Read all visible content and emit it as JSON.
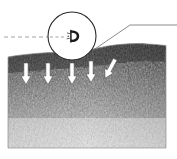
{
  "figure": {
    "background_color": "#ffffff",
    "width": 177,
    "height": 159
  },
  "specimen_panel": {
    "name": "fibrous-fracture-surface",
    "description": "Grainy fibrous cross-section texture, dark at the upper fracture zone fading lighter toward the bottom",
    "bounds": {
      "x": 8,
      "y": 47,
      "width": 158,
      "height": 101
    },
    "top_surface_profile": "irregular ridge rising from left to right",
    "colors": {
      "dark_zone": "#4a4a4a",
      "mid_zone": "#8c8c8c",
      "light_zone": "#d8d8d8",
      "border": "#9a9a9a"
    }
  },
  "load_arrows": {
    "name": "applied-load-arrows",
    "count": 5,
    "color": "#ffffff",
    "outline_color": "#555555",
    "direction": "downward",
    "items": [
      {
        "label": "arrow-1",
        "x": 26,
        "y": 63,
        "length": 22,
        "rotation": 0
      },
      {
        "label": "arrow-2",
        "x": 48,
        "y": 63,
        "length": 22,
        "rotation": 0
      },
      {
        "label": "arrow-3",
        "x": 72,
        "y": 63,
        "length": 22,
        "rotation": 0
      },
      {
        "label": "arrow-4",
        "x": 91,
        "y": 61,
        "length": 22,
        "rotation": 0
      },
      {
        "label": "arrow-5",
        "x": 110,
        "y": 58,
        "length": 22,
        "rotation": 28
      }
    ]
  },
  "callout_circle": {
    "name": "magnification-circle",
    "center_x": 72,
    "center_y": 36,
    "radius": 24,
    "stroke_color": "#2b2b2b",
    "fill_color": "#ffffff",
    "detail_name": "crack-tip-detail",
    "detail_description": "small dark hooked crack-tip mark at circle centre"
  },
  "dash_line": {
    "name": "axis-dashed-line",
    "from_x": 4,
    "to_x": 72,
    "y": 37,
    "color": "#8a8a8a",
    "dash_pattern": "4 3"
  },
  "leader_line": {
    "name": "callout-leader-line",
    "color": "#6e6e6e",
    "points": "92,51 130,25 177,25"
  }
}
